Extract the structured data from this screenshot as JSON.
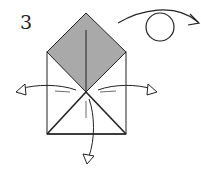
{
  "diagram": {
    "type": "origami-instruction",
    "step_number": "3",
    "colors": {
      "paper_colored": "#a9a9a9",
      "paper_white": "#ffffff",
      "line": "#222222"
    },
    "symbols": [
      "turn-over-symbol",
      "unfold-arrow-left",
      "unfold-arrow-right",
      "unfold-arrow-down"
    ]
  }
}
